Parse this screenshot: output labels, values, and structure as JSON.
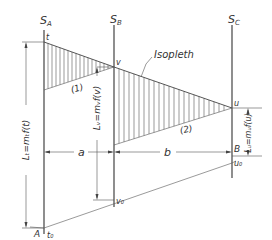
{
  "diagram": {
    "type": "nomogram-isopleth",
    "scales": [
      {
        "id": "SA",
        "label": "S",
        "sub": "A",
        "x": 44
      },
      {
        "id": "SB",
        "label": "S",
        "sub": "B",
        "x": 114
      },
      {
        "id": "SC",
        "label": "S",
        "sub": "C",
        "x": 232
      }
    ],
    "points": {
      "t": "t",
      "v": "v",
      "u": "u",
      "t0": "t₀",
      "v0": "v₀",
      "u0": "u₀",
      "A": "A",
      "B": "B"
    },
    "labels": {
      "isopleth": "Isopleth",
      "region1": "(1)",
      "region2": "(2)",
      "dim_a": "a",
      "dim_b": "b",
      "Lt": "Lₜ=mₜf(t)",
      "Lv": "Lᵥ=mᵥf(v)",
      "Lu": "Lᵤ=mᵤf(u)"
    },
    "colors": {
      "stroke": "#444444",
      "text": "#333333",
      "background": "#ffffff"
    }
  }
}
